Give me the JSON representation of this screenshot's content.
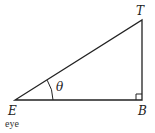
{
  "diagram": {
    "type": "right-triangle",
    "vertices": {
      "E": {
        "label": "E",
        "caption": "eye"
      },
      "B": {
        "label": "B"
      },
      "T": {
        "label": "T"
      }
    },
    "angle_label": "θ",
    "right_angle_at": "B",
    "colors": {
      "stroke": "#222222",
      "background": "#ffffff"
    }
  }
}
